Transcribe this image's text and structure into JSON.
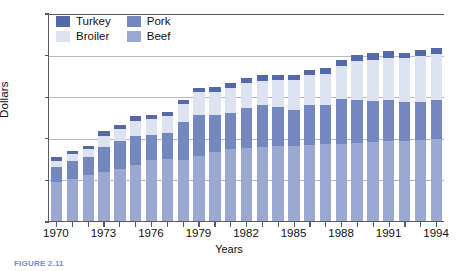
{
  "chart_data": {
    "type": "bar",
    "stacked": true,
    "title": "",
    "xlabel": "Years",
    "ylabel": "Dollars",
    "ylim": [
      0,
      500
    ],
    "ytick_interval": 100,
    "yticks": [
      0,
      100,
      200,
      300,
      400,
      500
    ],
    "grid": true,
    "legend_position": "top-left",
    "categories": [
      "1970",
      "1971",
      "1972",
      "1973",
      "1974",
      "1975",
      "1976",
      "1977",
      "1978",
      "1979",
      "1980",
      "1981",
      "1982",
      "1983",
      "1984",
      "1985",
      "1986",
      "1987",
      "1988",
      "1989",
      "1990",
      "1991",
      "1992",
      "1993",
      "1994"
    ],
    "tick_labels": [
      "1970",
      "1973",
      "1976",
      "1979",
      "1982",
      "1985",
      "1988",
      "1991",
      "1994"
    ],
    "stack_order_bottom_to_top": [
      "Beef",
      "Pork",
      "Broiler",
      "Turkey"
    ],
    "series": [
      {
        "name": "Beef",
        "color": "#9aa8d2",
        "values": [
          93,
          101,
          110,
          117,
          126,
          134,
          147,
          150,
          146,
          157,
          167,
          172,
          175,
          177,
          180,
          181,
          182,
          184,
          186,
          188,
          190,
          193,
          192,
          194,
          196
        ]
      },
      {
        "name": "Pork",
        "color": "#7487be",
        "values": [
          38,
          44,
          45,
          62,
          66,
          70,
          59,
          62,
          93,
          99,
          88,
          88,
          96,
          101,
          94,
          86,
          96,
          94,
          107,
          103,
          99,
          98,
          95,
          93,
          94
        ]
      },
      {
        "name": "Broiler",
        "color": "#dde3f1",
        "values": [
          14,
          15,
          17,
          26,
          30,
          37,
          39,
          40,
          42,
          53,
          56,
          60,
          60,
          59,
          65,
          71,
          72,
          76,
          79,
          94,
          99,
          102,
          104,
          110,
          111
        ]
      },
      {
        "name": "Turkey",
        "color": "#5568a8",
        "values": [
          9,
          8,
          9,
          11,
          10,
          11,
          10,
          10,
          11,
          12,
          12,
          12,
          12,
          13,
          13,
          13,
          14,
          14,
          14,
          15,
          15,
          15,
          14,
          15,
          15
        ]
      }
    ],
    "totals": [
      154,
      168,
      181,
      216,
      232,
      252,
      255,
      262,
      292,
      321,
      323,
      332,
      343,
      350,
      352,
      351,
      364,
      368,
      386,
      400,
      403,
      408,
      405,
      412,
      416
    ]
  },
  "legend": {
    "items": [
      {
        "label": "Turkey",
        "color": "#5568a8"
      },
      {
        "label": "Pork",
        "color": "#7487be"
      },
      {
        "label": "Broiler",
        "color": "#dde3f1"
      },
      {
        "label": "Beef",
        "color": "#9aa8d2"
      }
    ]
  },
  "axes": {
    "y_title": "Dollars",
    "x_title": "Years"
  },
  "caption": {
    "text": "FIGURE 2.11"
  }
}
